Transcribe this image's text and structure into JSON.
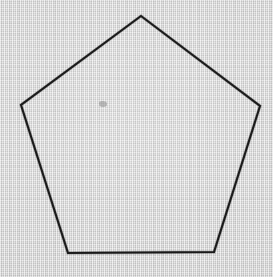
{
  "figure": {
    "shape_name": "regular-pentagon",
    "sides": 5,
    "canvas": {
      "width": 273,
      "height": 277,
      "background_color": "#d9d9d9",
      "texture": "paper-weave"
    },
    "stroke": {
      "color": "#1a1a1a",
      "width": 2.1,
      "bleed_color": "#4a4a4a",
      "bleed_width": 3.4,
      "linejoin": "miter"
    },
    "vertices": [
      {
        "name": "apex",
        "x": 141,
        "y": 16
      },
      {
        "name": "right",
        "x": 260,
        "y": 106
      },
      {
        "name": "bottom-right",
        "x": 214,
        "y": 252
      },
      {
        "name": "bottom-left",
        "x": 68,
        "y": 253
      },
      {
        "name": "left",
        "x": 21,
        "y": 105
      }
    ],
    "points_attr": "141,16 260,106 214,252 68,253 21,105",
    "artifact": {
      "name": "ink-smudge",
      "x": 99,
      "y": 101,
      "width": 8,
      "height": 6,
      "color": "#8e8e8e"
    }
  }
}
